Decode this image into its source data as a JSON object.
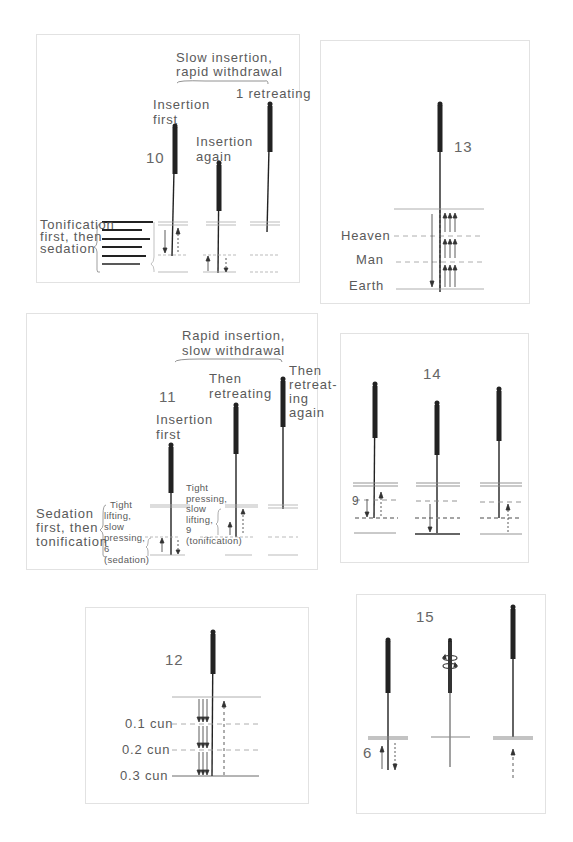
{
  "figures": {
    "fig10": {
      "number": "10",
      "bracket_label_1": "Slow insertion,",
      "bracket_label_2": "rapid withdrawal",
      "needle1_label_1": "Insertion",
      "needle1_label_2": "first",
      "needle2_label_1": "Insertion",
      "needle2_label_2": "again",
      "needle3_label": "1 retreating",
      "side_label_1": "Tonification",
      "side_label_2": "first, then",
      "side_label_3": "sedation"
    },
    "fig11": {
      "number": "11",
      "bracket_label_1": "Rapid insertion,",
      "bracket_label_2": "slow withdrawal",
      "needle1_label_1": "Insertion",
      "needle1_label_2": "first",
      "needle2_label_1": "Then",
      "needle2_label_2": "retreating",
      "needle3_label_1": "Then",
      "needle3_label_2": "retreat-",
      "needle3_label_3": "ing",
      "needle3_label_4": "again",
      "side_label_1": "Sedation",
      "side_label_2": "first, then",
      "side_label_3": "tonification",
      "sedation_note": [
        "Tight",
        "lifting,",
        "slow",
        "pressing,",
        "6",
        "(sedation)"
      ],
      "tonification_note": [
        "Tight",
        "pressing,",
        "slow",
        "lifting,",
        "9",
        "(tonification)"
      ]
    },
    "fig12": {
      "number": "12",
      "levels": [
        "0.1 cun",
        "0.2 cun",
        "0.3 cun"
      ]
    },
    "fig13": {
      "number": "13",
      "levels": [
        "Heaven",
        "Man",
        "Earth"
      ]
    },
    "fig14": {
      "number": "14",
      "count_label": "9"
    },
    "fig15": {
      "number": "15",
      "count_label": "6"
    }
  }
}
